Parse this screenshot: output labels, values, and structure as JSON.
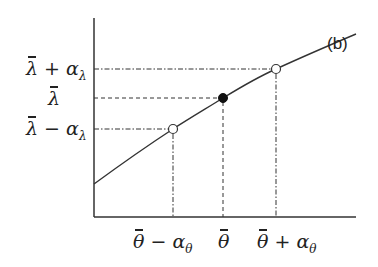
{
  "figure": {
    "panel_label": "(b)",
    "y_axis": {
      "labels": [
        {
          "base": "λ",
          "op": "+",
          "term": "α",
          "sub": "λ",
          "y": 69
        },
        {
          "base": "λ",
          "op": "",
          "term": "",
          "sub": "",
          "y": 98
        },
        {
          "base": "λ",
          "op": "−",
          "term": "α",
          "sub": "λ",
          "y": 129
        }
      ]
    },
    "x_axis": {
      "labels": [
        {
          "base": "θ",
          "op": "−",
          "term": "α",
          "sub": "θ",
          "x": 173
        },
        {
          "base": "θ",
          "op": "",
          "term": "",
          "sub": "",
          "x": 223
        },
        {
          "base": "θ",
          "op": "+",
          "term": "α",
          "sub": "θ",
          "x": 276
        }
      ]
    },
    "points": [
      {
        "name": "lower",
        "x": 173,
        "y": 129,
        "fill": "open"
      },
      {
        "name": "mean",
        "x": 223,
        "y": 98,
        "fill": "filled"
      },
      {
        "name": "upper",
        "x": 276,
        "y": 69,
        "fill": "open"
      }
    ],
    "colors": {
      "ink": "#222222",
      "background": "#ffffff"
    }
  }
}
